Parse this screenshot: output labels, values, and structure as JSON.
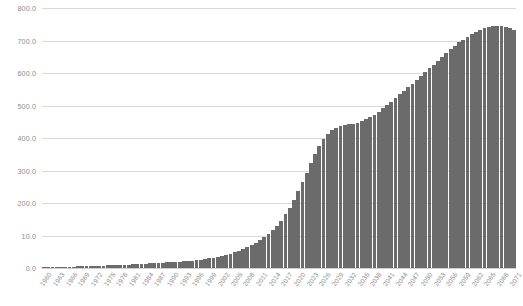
{
  "chart_data": {
    "type": "bar",
    "title": "",
    "subtitle": "",
    "xlabel": "",
    "ylabel": "",
    "grid": true,
    "legend": null,
    "legend_position": "none",
    "bar_color": "#6b6b6b",
    "grid_color": "#d9d9d9",
    "axis_text_color": "#8d8d8d",
    "background_color": "#ffffff",
    "ylim": [
      0,
      800
    ],
    "ytick_values": [
      0,
      100,
      200,
      300,
      400,
      500,
      600,
      700,
      800
    ],
    "ytick_labels": [
      "0.0",
      "10.0",
      "200.0",
      "300.0",
      "400.0",
      "500.0",
      "600.0",
      "700.0",
      "800.0"
    ],
    "xtick_labels": [
      "1960",
      "1963",
      "1966",
      "1969",
      "1972",
      "1975",
      "1978",
      "1981",
      "1984",
      "1987",
      "1990",
      "1993",
      "1996",
      "1999",
      "2002",
      "2005",
      "2008",
      "2011",
      "2014",
      "2017",
      "2020",
      "2023",
      "2026",
      "2029",
      "2032",
      "2035",
      "2038",
      "2041",
      "2044",
      "2047",
      "2050",
      "2053",
      "2056",
      "2059",
      "2062",
      "2065",
      "2068",
      "2071"
    ],
    "xtick_step": 3,
    "categories": [
      "1960",
      "1961",
      "1962",
      "1963",
      "1964",
      "1965",
      "1966",
      "1967",
      "1968",
      "1969",
      "1970",
      "1971",
      "1972",
      "1973",
      "1974",
      "1975",
      "1976",
      "1977",
      "1978",
      "1979",
      "1980",
      "1981",
      "1982",
      "1983",
      "1984",
      "1985",
      "1986",
      "1987",
      "1988",
      "1989",
      "1990",
      "1991",
      "1992",
      "1993",
      "1994",
      "1995",
      "1996",
      "1997",
      "1998",
      "1999",
      "2000",
      "2001",
      "2002",
      "2003",
      "2004",
      "2005",
      "2006",
      "2007",
      "2008",
      "2009",
      "2010",
      "2011",
      "2012",
      "2013",
      "2014",
      "2015",
      "2016",
      "2017",
      "2018",
      "2019",
      "2020",
      "2021",
      "2022",
      "2023",
      "2024",
      "2025",
      "2026",
      "2027",
      "2028",
      "2029",
      "2030",
      "2031",
      "2032",
      "2033",
      "2034",
      "2035",
      "2036",
      "2037",
      "2038",
      "2039",
      "2040",
      "2041",
      "2042",
      "2043",
      "2044",
      "2045",
      "2046",
      "2047",
      "2048",
      "2049",
      "2050",
      "2051",
      "2052",
      "2053",
      "2054",
      "2055",
      "2056",
      "2057",
      "2058",
      "2059",
      "2060",
      "2061",
      "2062",
      "2063",
      "2064",
      "2065",
      "2066",
      "2067",
      "2068",
      "2069",
      "2070",
      "2071"
    ],
    "values": [
      2,
      2,
      3,
      3,
      3,
      4,
      4,
      4,
      5,
      5,
      5,
      6,
      6,
      7,
      7,
      8,
      8,
      9,
      9,
      10,
      10,
      11,
      12,
      12,
      13,
      14,
      15,
      15,
      16,
      17,
      18,
      19,
      20,
      21,
      22,
      23,
      25,
      26,
      28,
      30,
      32,
      34,
      37,
      40,
      44,
      48,
      53,
      58,
      64,
      70,
      77,
      85,
      94,
      104,
      116,
      130,
      146,
      165,
      186,
      210,
      236,
      264,
      293,
      322,
      350,
      375,
      396,
      412,
      424,
      432,
      437,
      440,
      442,
      444,
      447,
      451,
      457,
      464,
      472,
      481,
      491,
      501,
      512,
      523,
      534,
      545,
      556,
      567,
      578,
      590,
      602,
      614,
      626,
      638,
      650,
      662,
      673,
      684,
      694,
      703,
      712,
      720,
      727,
      733,
      738,
      742,
      744,
      745,
      745,
      743,
      739,
      733
    ]
  }
}
